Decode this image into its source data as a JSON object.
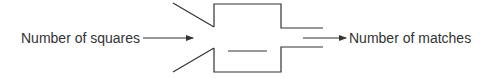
{
  "diagram": {
    "input_label": "Number of squares",
    "output_label": "Number of matches",
    "stroke_color": "#333333",
    "background": "#ffffff"
  }
}
